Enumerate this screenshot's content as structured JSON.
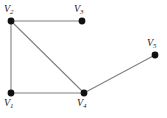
{
  "figure": {
    "background_color": "#ffffff",
    "edge_color": "#808080",
    "vertex_color": "#111111",
    "label_color": "#1a1a1a",
    "width": 167,
    "height": 118
  },
  "graph_data": {
    "type": "node-link-diagram",
    "directed": false,
    "vertex_count": 5,
    "edge_count": 5,
    "vertices": [
      {
        "id": "V1",
        "letter": "V",
        "subscript": "1",
        "label": "V1",
        "x": 11,
        "y": 93,
        "label_x": 4,
        "label_y": 98,
        "label_position": "below-left"
      },
      {
        "id": "V2",
        "letter": "V",
        "subscript": "2",
        "label": "V2",
        "x": 11,
        "y": 21,
        "label_x": 4,
        "label_y": 4,
        "label_position": "above-left"
      },
      {
        "id": "V3",
        "letter": "V",
        "subscript": "3",
        "label": "V3",
        "x": 82,
        "y": 21,
        "label_x": 74,
        "label_y": 4,
        "label_position": "above-left"
      },
      {
        "id": "V4",
        "letter": "V",
        "subscript": "4",
        "label": "V4",
        "x": 84,
        "y": 93,
        "label_x": 77,
        "label_y": 98,
        "label_position": "below-center"
      },
      {
        "id": "V5",
        "letter": "V",
        "subscript": "5",
        "label": "V5",
        "x": 155,
        "y": 55,
        "label_x": 147,
        "label_y": 38,
        "label_position": "above-left"
      }
    ],
    "edges": [
      {
        "source": "V2",
        "target": "V3",
        "orientation": "horizontal-top"
      },
      {
        "source": "V2",
        "target": "V1",
        "orientation": "vertical-left"
      },
      {
        "source": "V2",
        "target": "V4",
        "orientation": "diagonal"
      },
      {
        "source": "V1",
        "target": "V4",
        "orientation": "horizontal-bottom"
      },
      {
        "source": "V4",
        "target": "V5",
        "orientation": "diagonal"
      }
    ]
  }
}
